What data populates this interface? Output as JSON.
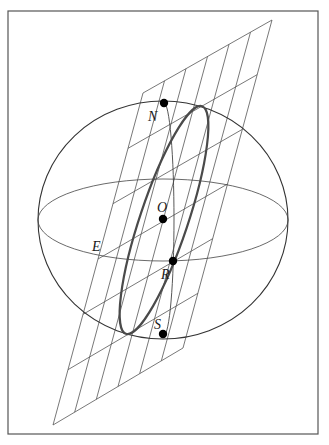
{
  "figure": {
    "frame": {
      "x": 8,
      "y": 11,
      "width": 310,
      "height": 423,
      "stroke": "#555555"
    },
    "sphere": {
      "cx": 163,
      "cy": 220,
      "rx": 125,
      "ry": 119,
      "stroke": "#333333"
    },
    "equator": {
      "cx": 163,
      "cy": 220,
      "rx": 125,
      "ry": 41,
      "stroke": "#444444"
    },
    "meridian": {
      "cx": 164,
      "cy": 219,
      "rx": 10,
      "ry": 116,
      "stroke": "#444444"
    },
    "plane": {
      "corners": {
        "top_left": [
          143,
          93
        ],
        "top_right": [
          272,
          20
        ],
        "bottom_right": [
          183,
          348
        ],
        "bottom_left": [
          53,
          425
        ]
      },
      "grid_divisions": 6,
      "stroke": "#555555"
    },
    "circle_on_plane": {
      "cx": 164,
      "cy": 220,
      "rx": 24,
      "ry": 120,
      "rotate_deg": 18.5,
      "stroke": "#4a4a4a"
    },
    "points": [
      {
        "id": "N",
        "label": "N",
        "x": 164,
        "y": 103,
        "label_x": 148,
        "label_y": 121
      },
      {
        "id": "O",
        "label": "O",
        "x": 163,
        "y": 219,
        "label_x": 157,
        "label_y": 212
      },
      {
        "id": "R",
        "label": "R",
        "x": 173,
        "y": 261,
        "label_x": 161,
        "label_y": 279
      },
      {
        "id": "S",
        "label": "S",
        "x": 163,
        "y": 334,
        "label_x": 154,
        "label_y": 329
      }
    ],
    "annotations": [
      {
        "id": "E",
        "label": "E",
        "label_x": 92,
        "label_y": 251
      }
    ]
  }
}
